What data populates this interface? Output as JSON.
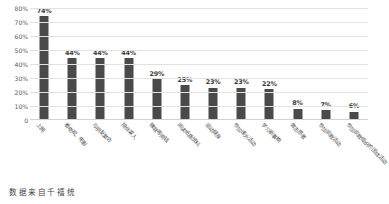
{
  "chart_data": {
    "type": "bar",
    "title": "",
    "xlabel": "",
    "ylabel": "",
    "ylim": [
      0,
      80
    ],
    "ytick_labels": [
      "80%",
      "70%",
      "60%",
      "50%",
      "40%",
      "30%",
      "20%",
      "10%",
      "0"
    ],
    "ytick_values": [
      80,
      70,
      60,
      50,
      40,
      30,
      20,
      10,
      0
    ],
    "grid": true,
    "legend": "none",
    "bar_color": "#4a4a4a",
    "categories": [
      "上网",
      "看电视、电影",
      "与朋友聚会",
      "陪伴家人",
      "赚取零用钱",
      "阅读纸质资料",
      "运动健身",
      "参加课外活动",
      "学习新事物",
      "做志愿者",
      "参加宗教活动",
      "参加宗教组织的团体活动"
    ],
    "values": [
      74,
      44,
      44,
      44,
      29,
      25,
      23,
      23,
      22,
      8,
      7,
      6
    ],
    "data_labels": [
      "74%",
      "44%",
      "44%",
      "44%",
      "29%",
      "25%",
      "23%",
      "23%",
      "22%",
      "8%",
      "7%",
      "6%"
    ]
  },
  "caption": {
    "text": "数据来自千禧统"
  }
}
